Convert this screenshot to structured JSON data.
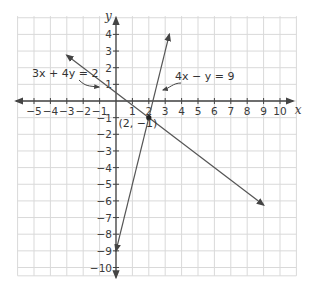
{
  "chart_data": {
    "type": "line",
    "title": "",
    "xlabel": "x",
    "ylabel": "y",
    "xlim": [
      -6,
      11
    ],
    "ylim": [
      -10.5,
      5
    ],
    "grid": true,
    "x_ticks": [
      -5,
      -4,
      -3,
      -2,
      -1,
      1,
      2,
      3,
      4,
      5,
      6,
      7,
      8,
      9,
      10
    ],
    "y_ticks": [
      4,
      3,
      2,
      1,
      -1,
      -2,
      -3,
      -4,
      -5,
      -6,
      -7,
      -8,
      -9,
      -10
    ],
    "x_tick_labels": [
      "−5",
      "−4",
      "−3",
      "−2",
      "−1",
      "1",
      "2",
      "3",
      "4",
      "5",
      "6",
      "7",
      "8",
      "9",
      "10"
    ],
    "y_tick_labels": [
      "4",
      "3",
      "2",
      "1",
      "−1",
      "−2",
      "−3",
      "−4",
      "−5",
      "−6",
      "−7",
      "−8",
      "−9",
      "−10"
    ],
    "series": [
      {
        "name": "3x + 4y = 2",
        "label": "3x + 4y = 2",
        "equation": "y = (2 - 3x)/4",
        "x": [
          -3,
          9
        ],
        "y": [
          2.75,
          -6.25
        ]
      },
      {
        "name": "4x − y = 9",
        "label": "4x − y = 9",
        "equation": "y = 4x - 9",
        "x": [
          0,
          3.25
        ],
        "y": [
          -9,
          4
        ]
      }
    ],
    "annotations": [
      {
        "text": "(2, −1)",
        "x": 2,
        "y": -1,
        "type": "intersection-point"
      },
      {
        "text": "3x + 4y = 2",
        "points_to": "line-1"
      },
      {
        "text": "4x − y = 9",
        "points_to": "line-2"
      }
    ]
  },
  "labels": {
    "x_axis": "x",
    "y_axis": "y",
    "eq1": "3x + 4y = 2",
    "eq2": "4x − y = 9",
    "point": "(2, −1)"
  },
  "colors": {
    "grid": "#d9d9d9",
    "axis": "#444444",
    "line": "#555555",
    "text": "#333333"
  }
}
